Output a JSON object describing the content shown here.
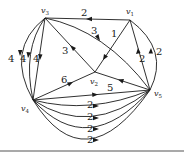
{
  "diagram": {
    "type": "directed-weighted-multigraph",
    "vertices": [
      {
        "id": "v1",
        "label": "v",
        "sub": "1",
        "x": 130,
        "y": 20,
        "lx": 126,
        "ly": 14
      },
      {
        "id": "v2",
        "label": "v",
        "sub": "2",
        "x": 95,
        "y": 72,
        "lx": 91,
        "ly": 84
      },
      {
        "id": "v3",
        "label": "v",
        "sub": "3",
        "x": 45,
        "y": 18,
        "lx": 41,
        "ly": 13
      },
      {
        "id": "v4",
        "label": "v",
        "sub": "4",
        "x": 33,
        "y": 100,
        "lx": 22,
        "ly": 110
      },
      {
        "id": "v5",
        "label": "v",
        "sub": "5",
        "x": 150,
        "y": 90,
        "lx": 154,
        "ly": 95
      }
    ],
    "edges": [
      {
        "from": "v1",
        "to": "v3",
        "weight": "2",
        "lx": 84,
        "ly": 16
      },
      {
        "from": "v3",
        "to": "v5",
        "weight": "3",
        "lx": 93,
        "ly": 35
      },
      {
        "from": "v1",
        "to": "v2",
        "weight": "1",
        "lx": 113,
        "ly": 37
      },
      {
        "from": "v2",
        "to": "v3",
        "weight": "3",
        "lx": 64,
        "ly": 55
      },
      {
        "from": "v5",
        "to": "v1",
        "weight": "2",
        "lx": 140,
        "ly": 61
      },
      {
        "from": "v5",
        "to": "v1",
        "weight": "2",
        "curved": true,
        "lx": 157,
        "ly": 55
      },
      {
        "from": "v3",
        "to": "v4",
        "weight": "4",
        "lx": 36,
        "ly": 62
      },
      {
        "from": "v3",
        "to": "v4",
        "weight": "4",
        "curved": true,
        "lx": 23,
        "ly": 62
      },
      {
        "from": "v3",
        "to": "v4",
        "weight": "4",
        "curved": true,
        "lx": 10,
        "ly": 62
      },
      {
        "from": "v4",
        "to": "v2",
        "weight": "6",
        "lx": 63,
        "ly": 83
      },
      {
        "from": "v5",
        "to": "v2",
        "weight": "5",
        "lx": 108,
        "ly": 90
      },
      {
        "from": "v4",
        "to": "v5",
        "weight": "",
        "lx": 0,
        "ly": 0
      },
      {
        "from": "v4",
        "to": "v5",
        "weight": "2",
        "curved": true,
        "lx": 93,
        "ly": 108
      },
      {
        "from": "v4",
        "to": "v5",
        "weight": "2",
        "curved": true,
        "lx": 93,
        "ly": 120
      },
      {
        "from": "v4",
        "to": "v5",
        "weight": "2",
        "curved": true,
        "lx": 93,
        "ly": 132
      },
      {
        "from": "v4",
        "to": "v5",
        "weight": "2",
        "curved": true,
        "lx": 93,
        "ly": 143
      }
    ]
  }
}
